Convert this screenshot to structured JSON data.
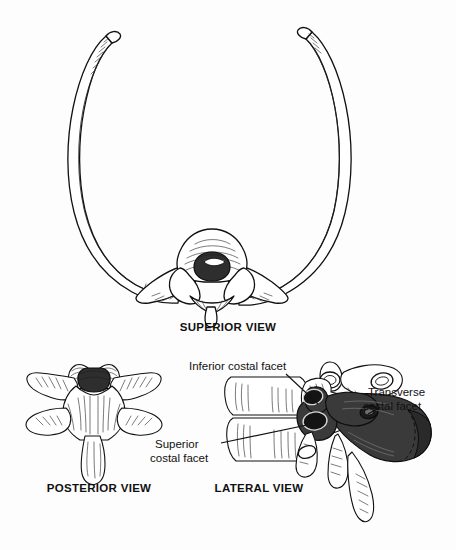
{
  "figure": {
    "background_color": "#fdfdfd",
    "ink_color": "#111111",
    "rib_fill_color": "#3a3a3a"
  },
  "panels": [
    {
      "id": "superior",
      "caption": "SUPERIOR VIEW",
      "description": "Thoracic vertebra seen from above with a pair of ribs curving forward to form the oval thoracic ring"
    },
    {
      "id": "posterior",
      "caption": "POSTERIOR VIEW",
      "description": "Thoracic vertebra seen from behind showing spinous process and transverse processes"
    },
    {
      "id": "lateral",
      "caption": "LATERAL VIEW",
      "description": "Two stacked thoracic vertebrae from the side with the head of a rib articulating"
    }
  ],
  "labels": [
    {
      "id": "inferior-costal-facet",
      "text": "Inferior costal facet",
      "lines": [
        "Inferior costal facet"
      ]
    },
    {
      "id": "superior-costal-facet",
      "text": "Superior costal facet",
      "lines": [
        "Superior",
        "costal facet"
      ]
    },
    {
      "id": "transverse-costal-facet",
      "text": "Transverse costal facet",
      "lines": [
        "Transverse",
        "costal facet"
      ]
    }
  ]
}
